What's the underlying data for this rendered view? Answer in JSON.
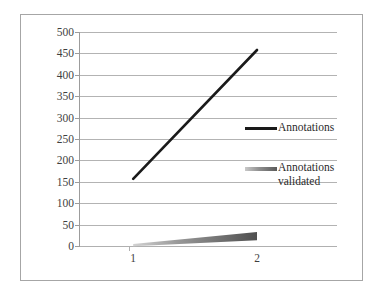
{
  "chart_data": {
    "type": "line",
    "title": "",
    "subtitle": "",
    "xlabel": "",
    "ylabel": "",
    "categories": [
      "1",
      "2"
    ],
    "x": [
      1,
      2
    ],
    "series": [
      {
        "name": "Annotations",
        "values": [
          157,
          458
        ],
        "color": "#1a1a1a"
      },
      {
        "name": "Annotations validated",
        "values": [
          2,
          23
        ],
        "color": "#5a5a5a"
      }
    ],
    "ylim": [
      0,
      500
    ],
    "ytick_step": 50,
    "yticks": [
      0,
      50,
      100,
      150,
      200,
      250,
      300,
      350,
      400,
      450,
      500
    ],
    "ytick_labels": [
      "0",
      "50",
      "100",
      "150",
      "200",
      "250",
      "300",
      "350",
      "400",
      "450",
      "500"
    ],
    "xtick_labels": [
      "1",
      "2"
    ],
    "grid": "horizontal",
    "legend_position": "right",
    "legend": [
      {
        "label": "Annotations"
      },
      {
        "label": "Annotations\nvalidated"
      }
    ]
  },
  "colors": {
    "series_1": "#1a1a1a",
    "series_2": "#5a5a5a",
    "gridline": "#b3b3b3",
    "axis": "#9c9c9c",
    "frame": "#a6a6a6",
    "text": "#3f3f3f",
    "background": "#ffffff"
  }
}
